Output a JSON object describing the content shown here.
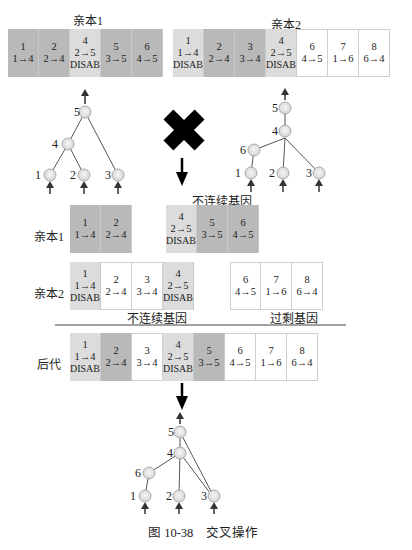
{
  "figure": {
    "caption": "图 10-38　交叉操作",
    "colors": {
      "matching_gene": "#b9b9b9",
      "disabled_gene": "#dcdcdc",
      "excess_gene": "#ffffff",
      "symbol": "#000000"
    }
  },
  "top": {
    "parent1": {
      "title": "亲本1",
      "genes": [
        {
          "id": "1",
          "conn": "1→4",
          "status": "",
          "shade": "dark"
        },
        {
          "id": "2",
          "conn": "2→4",
          "status": "",
          "shade": "dark"
        },
        {
          "id": "4",
          "conn": "2→5",
          "status": "DISAB",
          "shade": "light"
        },
        {
          "id": "5",
          "conn": "3→5",
          "status": "",
          "shade": "dark"
        },
        {
          "id": "6",
          "conn": "4→5",
          "status": "",
          "shade": "dark"
        }
      ]
    },
    "parent2": {
      "title": "亲本2",
      "genes": [
        {
          "id": "1",
          "conn": "1→4",
          "status": "DISAB",
          "shade": "light"
        },
        {
          "id": "2",
          "conn": "2→4",
          "status": "",
          "shade": "dark"
        },
        {
          "id": "3",
          "conn": "3→4",
          "status": "",
          "shade": "dark"
        },
        {
          "id": "4",
          "conn": "2→5",
          "status": "DISAB",
          "shade": "light"
        },
        {
          "id": "6",
          "conn": "4→5",
          "status": "",
          "shade": "white"
        },
        {
          "id": "7",
          "conn": "1→6",
          "status": "",
          "shade": "white"
        },
        {
          "id": "8",
          "conn": "6→4",
          "status": "",
          "shade": "white"
        }
      ]
    }
  },
  "networks": {
    "parent1": {
      "nodes": [
        {
          "label": "5"
        },
        {
          "label": "4"
        },
        {
          "label": "1"
        },
        {
          "label": "2"
        },
        {
          "label": "3"
        }
      ]
    },
    "parent2": {
      "nodes": [
        {
          "label": "5"
        },
        {
          "label": "4"
        },
        {
          "label": "6"
        },
        {
          "label": "1"
        },
        {
          "label": "2"
        },
        {
          "label": "3"
        }
      ]
    },
    "offspring": {
      "nodes": [
        {
          "label": "5"
        },
        {
          "label": "4"
        },
        {
          "label": "6"
        },
        {
          "label": "1"
        },
        {
          "label": "2"
        },
        {
          "label": "3"
        }
      ]
    },
    "cross_symbol": "✖"
  },
  "alignment": {
    "disjoint_label_top": "不连续基因",
    "parent1_label": "亲本1",
    "parent2_label": "亲本2",
    "disjoint_label_bottom": "不连续基因",
    "excess_label": "过剩基因",
    "offspring_label": "后代",
    "parent1_genes_a": [
      {
        "id": "1",
        "conn": "1→4",
        "status": ""
      },
      {
        "id": "2",
        "conn": "2→4",
        "status": ""
      }
    ],
    "parent1_genes_b": [
      {
        "id": "4",
        "conn": "2→5",
        "status": "DISAB"
      },
      {
        "id": "5",
        "conn": "3→5",
        "status": ""
      },
      {
        "id": "6",
        "conn": "4→5",
        "status": ""
      }
    ],
    "parent2_genes_a": [
      {
        "id": "1",
        "conn": "1→4",
        "status": "DISAB"
      },
      {
        "id": "2",
        "conn": "2→4",
        "status": ""
      },
      {
        "id": "3",
        "conn": "3→4",
        "status": ""
      },
      {
        "id": "4",
        "conn": "2→5",
        "status": "DISAB"
      }
    ],
    "parent2_genes_b": [
      {
        "id": "6",
        "conn": "4→5",
        "status": ""
      },
      {
        "id": "7",
        "conn": "1→6",
        "status": ""
      },
      {
        "id": "8",
        "conn": "6→4",
        "status": ""
      }
    ],
    "offspring_genes": [
      {
        "id": "1",
        "conn": "1→4",
        "status": "DISAB"
      },
      {
        "id": "2",
        "conn": "2→4",
        "status": ""
      },
      {
        "id": "3",
        "conn": "3→4",
        "status": ""
      },
      {
        "id": "4",
        "conn": "2→5",
        "status": "DISAB"
      },
      {
        "id": "5",
        "conn": "3→5",
        "status": ""
      },
      {
        "id": "6",
        "conn": "4→5",
        "status": ""
      },
      {
        "id": "7",
        "conn": "1→6",
        "status": ""
      },
      {
        "id": "8",
        "conn": "6→4",
        "status": ""
      }
    ]
  }
}
